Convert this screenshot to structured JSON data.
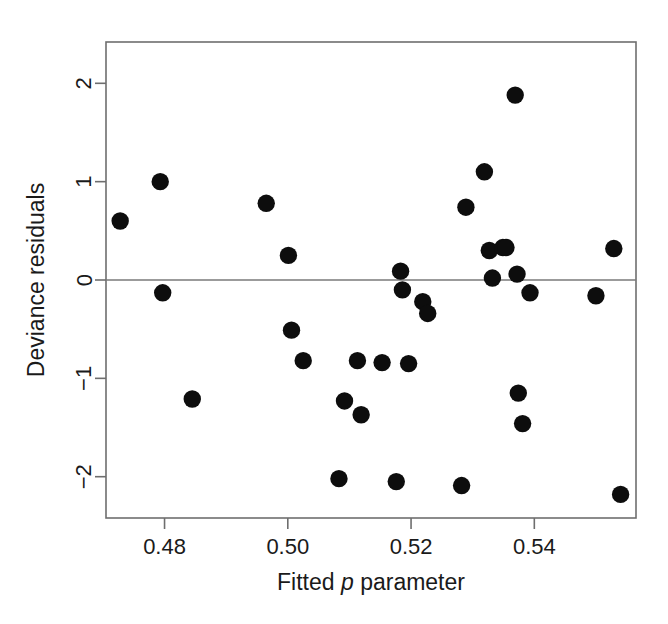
{
  "chart_data": {
    "type": "scatter",
    "title": "",
    "xlabel": "Fitted p parameter",
    "xlabel_parts": {
      "before": "Fitted ",
      "italic": "p",
      "after": " parameter"
    },
    "ylabel": "Deviance residuals",
    "xlim": [
      0.4705,
      0.5565
    ],
    "ylim": [
      -2.42,
      2.42
    ],
    "xticks": [
      0.48,
      0.5,
      0.52,
      0.54
    ],
    "xticklabels": [
      "0.48",
      "0.50",
      "0.52",
      "0.54"
    ],
    "yticks": [
      2,
      1,
      0,
      -1,
      -2
    ],
    "yticklabels": [
      "2",
      "1",
      "0",
      "−1",
      "−2"
    ],
    "grid": false,
    "legend": null,
    "reference_lines": [
      {
        "axis": "y",
        "value": 0
      }
    ],
    "marker": {
      "shape": "circle",
      "color": "#0d0d0d",
      "size": 9
    },
    "points": [
      {
        "x": 0.4728,
        "y": 0.6
      },
      {
        "x": 0.4793,
        "y": 1.0
      },
      {
        "x": 0.4797,
        "y": -0.13
      },
      {
        "x": 0.4845,
        "y": -1.21
      },
      {
        "x": 0.4965,
        "y": 0.78
      },
      {
        "x": 0.5001,
        "y": 0.25
      },
      {
        "x": 0.5006,
        "y": -0.51
      },
      {
        "x": 0.5025,
        "y": -0.82
      },
      {
        "x": 0.5083,
        "y": -2.02
      },
      {
        "x": 0.5092,
        "y": -1.23
      },
      {
        "x": 0.5113,
        "y": -0.82
      },
      {
        "x": 0.5119,
        "y": -1.37
      },
      {
        "x": 0.5153,
        "y": -0.84
      },
      {
        "x": 0.5176,
        "y": -2.05
      },
      {
        "x": 0.5183,
        "y": 0.09
      },
      {
        "x": 0.5186,
        "y": -0.1
      },
      {
        "x": 0.5196,
        "y": -0.85
      },
      {
        "x": 0.5219,
        "y": -0.22
      },
      {
        "x": 0.5227,
        "y": -0.34
      },
      {
        "x": 0.5282,
        "y": -2.09
      },
      {
        "x": 0.5289,
        "y": 0.74
      },
      {
        "x": 0.5319,
        "y": 1.1
      },
      {
        "x": 0.5327,
        "y": 0.3
      },
      {
        "x": 0.5332,
        "y": 0.02
      },
      {
        "x": 0.5349,
        "y": 0.33
      },
      {
        "x": 0.5354,
        "y": 0.33
      },
      {
        "x": 0.5369,
        "y": 1.88
      },
      {
        "x": 0.5372,
        "y": 0.06
      },
      {
        "x": 0.5374,
        "y": -1.15
      },
      {
        "x": 0.5381,
        "y": -1.46
      },
      {
        "x": 0.5393,
        "y": -0.13
      },
      {
        "x": 0.55,
        "y": -0.16
      },
      {
        "x": 0.5529,
        "y": 0.32
      },
      {
        "x": 0.554,
        "y": -2.18
      }
    ]
  }
}
